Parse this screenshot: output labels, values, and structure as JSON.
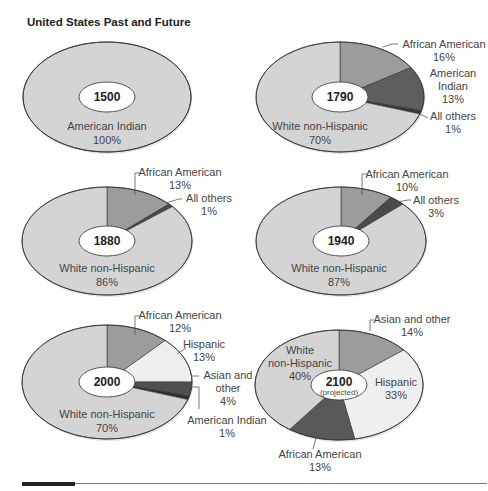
{
  "title": "United States Past and Future",
  "colors": {
    "white_non_hispanic": "#d4d4d4",
    "american_indian_1500": "#d4d4d4",
    "african_american": "#9c9c9c",
    "american_indian": "#5e5e5e",
    "all_others": "#4a4a4a",
    "hispanic": "#efefef",
    "asian_other": "#4f4f4f",
    "asian_other_2100": "#9c9c9c",
    "african_american_2100": "#595959",
    "outline": "#333333"
  },
  "chart_data": [
    {
      "type": "pie",
      "title": "1500",
      "categories": [
        "American Indian"
      ],
      "values": [
        100
      ],
      "labels": [
        "American Indian 100%"
      ]
    },
    {
      "type": "pie",
      "title": "1790",
      "categories": [
        "African American",
        "American Indian",
        "All others",
        "White non-Hispanic"
      ],
      "values": [
        16,
        13,
        1,
        70
      ]
    },
    {
      "type": "pie",
      "title": "1880",
      "categories": [
        "African American",
        "All others",
        "White non-Hispanic"
      ],
      "values": [
        13,
        1,
        86
      ]
    },
    {
      "type": "pie",
      "title": "1940",
      "categories": [
        "African American",
        "All others",
        "White non-Hispanic"
      ],
      "values": [
        10,
        3,
        87
      ]
    },
    {
      "type": "pie",
      "title": "2000",
      "categories": [
        "African American",
        "Hispanic",
        "Asian and other",
        "American Indian",
        "White non-Hispanic"
      ],
      "values": [
        12,
        13,
        4,
        1,
        70
      ]
    },
    {
      "type": "pie",
      "title": "2100",
      "subtitle": "(projected)",
      "categories": [
        "Asian and other",
        "Hispanic",
        "African American",
        "White non-Hispanic"
      ],
      "values": [
        14,
        33,
        13,
        40
      ]
    }
  ],
  "pies": [
    {
      "year": "1500",
      "cx": 107,
      "cy": 97,
      "rx": 84,
      "ry": 55,
      "slices": [
        {
          "value": 100,
          "color": "#d4d4d4"
        }
      ],
      "labels": [
        {
          "text": "American Indian",
          "x": 107,
          "y": 130,
          "anchor": "middle"
        },
        {
          "text": "100%",
          "x": 107,
          "y": 144,
          "anchor": "middle"
        }
      ],
      "leaders": []
    },
    {
      "year": "1790",
      "cx": 340,
      "cy": 97,
      "rx": 84,
      "ry": 55,
      "slices": [
        {
          "value": 16,
          "color": "#9c9c9c"
        },
        {
          "value": 13,
          "color": "#5e5e5e"
        },
        {
          "value": 1,
          "color": "#3a3a3a"
        },
        {
          "value": 70,
          "color": "#d4d4d4"
        }
      ],
      "labels": [
        {
          "text": "African American",
          "x": 444,
          "y": 48,
          "anchor": "middle"
        },
        {
          "text": "16%",
          "x": 444,
          "y": 61,
          "anchor": "middle"
        },
        {
          "text": "American",
          "x": 453,
          "y": 77,
          "anchor": "middle"
        },
        {
          "text": "Indian",
          "x": 453,
          "y": 90,
          "anchor": "middle"
        },
        {
          "text": "13%",
          "x": 453,
          "y": 103,
          "anchor": "middle"
        },
        {
          "text": "All others",
          "x": 453,
          "y": 120,
          "anchor": "middle"
        },
        {
          "text": "1%",
          "x": 453,
          "y": 133,
          "anchor": "middle"
        },
        {
          "text": "White non-Hispanic",
          "x": 320,
          "y": 130,
          "anchor": "middle"
        },
        {
          "text": "70%",
          "x": 320,
          "y": 144,
          "anchor": "middle"
        }
      ],
      "leaders": [
        {
          "points": "383,47 392,44 398,44"
        },
        {
          "points": "420,114 428,118"
        }
      ]
    },
    {
      "year": "1880",
      "cx": 107,
      "cy": 241,
      "rx": 85,
      "ry": 54,
      "slices": [
        {
          "value": 13,
          "color": "#9c9c9c"
        },
        {
          "value": 1,
          "color": "#4a4a4a"
        },
        {
          "value": 86,
          "color": "#d4d4d4"
        }
      ],
      "labels": [
        {
          "text": "African American",
          "x": 180,
          "y": 176,
          "anchor": "middle"
        },
        {
          "text": "13%",
          "x": 180,
          "y": 189,
          "anchor": "middle"
        },
        {
          "text": "All others",
          "x": 209,
          "y": 202,
          "anchor": "middle"
        },
        {
          "text": "1%",
          "x": 209,
          "y": 215,
          "anchor": "middle"
        },
        {
          "text": "White non-Hispanic",
          "x": 107,
          "y": 272,
          "anchor": "middle"
        },
        {
          "text": "86%",
          "x": 107,
          "y": 286,
          "anchor": "middle"
        }
      ],
      "leaders": [
        {
          "points": "135,195 135,173 141,173"
        },
        {
          "points": "166,203 179,199 182,199"
        }
      ]
    },
    {
      "year": "1940",
      "cx": 341,
      "cy": 241,
      "rx": 85,
      "ry": 54,
      "slices": [
        {
          "value": 10,
          "color": "#9c9c9c"
        },
        {
          "value": 3,
          "color": "#4a4a4a"
        },
        {
          "value": 87,
          "color": "#d4d4d4"
        }
      ],
      "labels": [
        {
          "text": "African American",
          "x": 407,
          "y": 178,
          "anchor": "middle"
        },
        {
          "text": "10%",
          "x": 407,
          "y": 191,
          "anchor": "middle"
        },
        {
          "text": "All others",
          "x": 436,
          "y": 204,
          "anchor": "middle"
        },
        {
          "text": "3%",
          "x": 436,
          "y": 217,
          "anchor": "middle"
        },
        {
          "text": "White non-Hispanic",
          "x": 339,
          "y": 272,
          "anchor": "middle"
        },
        {
          "text": "87%",
          "x": 339,
          "y": 286,
          "anchor": "middle"
        }
      ],
      "leaders": [
        {
          "points": "362,195 362,174 368,174"
        },
        {
          "points": "397,202 408,200 411,200"
        }
      ]
    },
    {
      "year": "2000",
      "cx": 107,
      "cy": 382,
      "rx": 85,
      "ry": 57,
      "slices": [
        {
          "value": 12,
          "color": "#9c9c9c"
        },
        {
          "value": 13,
          "color": "#efefef"
        },
        {
          "value": 4,
          "color": "#4f4f4f"
        },
        {
          "value": 1,
          "color": "#2e2e2e"
        },
        {
          "value": 70,
          "color": "#d4d4d4"
        }
      ],
      "labels": [
        {
          "text": "African American",
          "x": 180,
          "y": 319,
          "anchor": "middle"
        },
        {
          "text": "12%",
          "x": 180,
          "y": 332,
          "anchor": "middle"
        },
        {
          "text": "Hispanic",
          "x": 204,
          "y": 348,
          "anchor": "middle"
        },
        {
          "text": "13%",
          "x": 204,
          "y": 361,
          "anchor": "middle"
        },
        {
          "text": "Asian and",
          "x": 228,
          "y": 379,
          "anchor": "middle"
        },
        {
          "text": "other",
          "x": 228,
          "y": 392,
          "anchor": "middle"
        },
        {
          "text": "4%",
          "x": 228,
          "y": 405,
          "anchor": "middle"
        },
        {
          "text": "American Indian",
          "x": 227,
          "y": 424,
          "anchor": "middle"
        },
        {
          "text": "1%",
          "x": 227,
          "y": 437,
          "anchor": "middle"
        },
        {
          "text": "White non-Hispanic",
          "x": 107,
          "y": 418,
          "anchor": "middle"
        },
        {
          "text": "70%",
          "x": 107,
          "y": 432,
          "anchor": "middle"
        }
      ],
      "leaders": [
        {
          "points": "135,335 135,316 141,316"
        },
        {
          "points": "177,354 186,348"
        },
        {
          "points": "191,376 199,376"
        },
        {
          "points": "191,387 199,387 199,409"
        }
      ]
    },
    {
      "year": "2100",
      "cx": 339,
      "cy": 385,
      "rx": 84,
      "ry": 55,
      "subtitle": "(projected)",
      "slices": [
        {
          "value": 14,
          "color": "#9c9c9c"
        },
        {
          "value": 33,
          "color": "#efefef"
        },
        {
          "value": 13,
          "color": "#595959"
        },
        {
          "value": 40,
          "color": "#d4d4d4"
        }
      ],
      "labels": [
        {
          "text": "Asian and other",
          "x": 412,
          "y": 323,
          "anchor": "middle"
        },
        {
          "text": "14%",
          "x": 412,
          "y": 336,
          "anchor": "middle"
        },
        {
          "text": "White",
          "x": 300,
          "y": 354,
          "anchor": "middle"
        },
        {
          "text": "non-Hispanic",
          "x": 300,
          "y": 367,
          "anchor": "middle"
        },
        {
          "text": "40%",
          "x": 300,
          "y": 380,
          "anchor": "middle"
        },
        {
          "text": "Hispanic",
          "x": 396,
          "y": 386,
          "anchor": "middle"
        },
        {
          "text": "33%",
          "x": 396,
          "y": 399,
          "anchor": "middle"
        },
        {
          "text": "African American",
          "x": 320,
          "y": 458,
          "anchor": "middle"
        },
        {
          "text": "13%",
          "x": 320,
          "y": 471,
          "anchor": "middle"
        }
      ],
      "leaders": [
        {
          "points": "370,331 370,320 374,320"
        },
        {
          "points": "316,438 313,449"
        }
      ]
    }
  ]
}
